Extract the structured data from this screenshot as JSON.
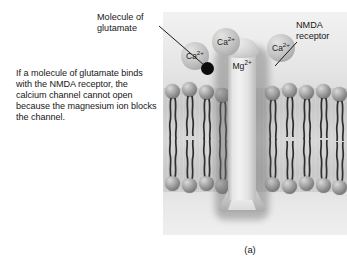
{
  "figure": {
    "subcaption": "(a)",
    "description": "If a molecule of glutamate binds with the NMDA receptor, the calcium channel cannot open because the magnesium ion blocks the channel.",
    "labels": {
      "glutamate": "Molecule of\nglutamate",
      "glutamate_line1": "Molecule of",
      "glutamate_line2": "glutamate",
      "nmda": "NMDA\nreceptor",
      "nmda_line1": "NMDA",
      "nmda_line2": "receptor"
    },
    "ions": [
      {
        "name": "calcium-ion-1",
        "element": "Ca",
        "charge": "2+"
      },
      {
        "name": "calcium-ion-2",
        "element": "Ca",
        "charge": "2+"
      },
      {
        "name": "calcium-ion-3",
        "element": "Ca",
        "charge": "2+"
      },
      {
        "name": "magnesium-ion",
        "element": "Mg",
        "charge": "2+"
      }
    ],
    "structures": {
      "channel": "NMDA receptor ion channel",
      "membrane": "phospholipid bilayer",
      "glutamate_molecule": "glutamate molecule"
    },
    "colors": {
      "background": "#ffffff",
      "panel": "#e9e9e9",
      "membrane_core": "#cfcfcf",
      "lipid_head": "#7d7d7d",
      "lipid_tail": "#2e2e2e",
      "channel": "#f2f2f2",
      "ion": "#c6c6c6",
      "glutamate": "#0b0b0b",
      "text": "#171717",
      "leader_line": "#1a1a1a"
    }
  }
}
